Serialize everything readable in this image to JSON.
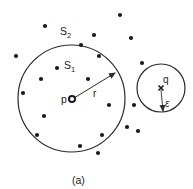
{
  "labels": {
    "set_outer": "S",
    "set_outer_sub": "2",
    "set_inner": "S",
    "set_inner_sub": "1",
    "center_point": "p",
    "radius": "r",
    "query_point": "q",
    "epsilon": "ε",
    "caption": "(a)"
  },
  "colors": {
    "stroke": "#2a2a2a",
    "dot": "#1a1a1a",
    "background": "#ffffff"
  }
}
